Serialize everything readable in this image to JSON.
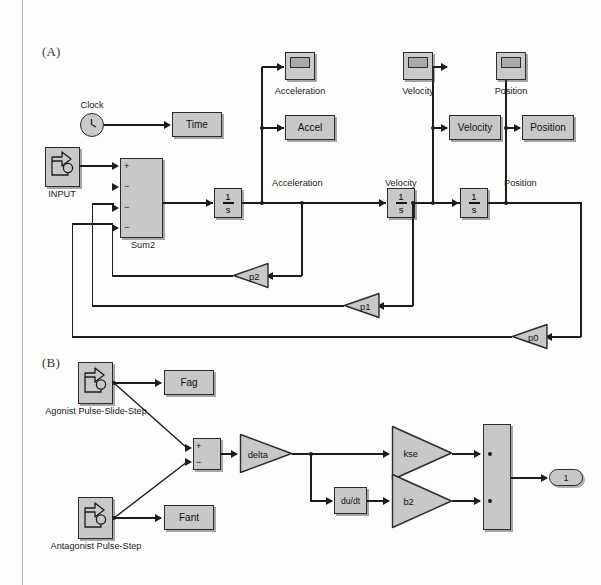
{
  "figure": {
    "panel_a_label": "(A)",
    "panel_b_label": "(B)"
  },
  "panel_a": {
    "clock": {
      "caption": "Clock"
    },
    "input": {
      "caption": "INPUT"
    },
    "sum": {
      "caption": "Sum2",
      "signs": [
        "+",
        "−",
        "−",
        "−"
      ]
    },
    "time_block": {
      "label": "Time"
    },
    "integrators": [
      {
        "num": "1",
        "den": "s"
      },
      {
        "num": "1",
        "den": "s"
      },
      {
        "num": "1",
        "den": "s"
      }
    ],
    "signal_labels": [
      "Acceleration",
      "Velocity",
      "Position"
    ],
    "scopes": [
      {
        "caption": "Acceleration"
      },
      {
        "caption": "Velocity"
      },
      {
        "caption": "Position"
      }
    ],
    "sinks": [
      {
        "label": "Accel"
      },
      {
        "label": "Velocity"
      },
      {
        "label": "Position"
      }
    ],
    "feedback_gains": [
      {
        "label": "p2"
      },
      {
        "label": "p1"
      },
      {
        "label": "p0"
      }
    ]
  },
  "panel_b": {
    "agonist": {
      "caption": "Agonist Pulse-Slide-Step"
    },
    "antagonist": {
      "caption": "Antagonist Pulse-Step"
    },
    "fag_block": {
      "label": "Fag"
    },
    "fant_block": {
      "label": "Fant"
    },
    "sum": {
      "signs": [
        "+",
        "−"
      ]
    },
    "delta_gain": {
      "label": "delta"
    },
    "kse_gain": {
      "label": "kse"
    },
    "b2_gain": {
      "label": "b2"
    },
    "derivative": {
      "label": "du/dt"
    },
    "output_port": {
      "label": "1"
    }
  },
  "colors": {
    "block_fill": "#c8c8c8",
    "block_stroke": "#2b2b2b",
    "wire": "#1d1d1d",
    "page": "#fdfdfc"
  }
}
